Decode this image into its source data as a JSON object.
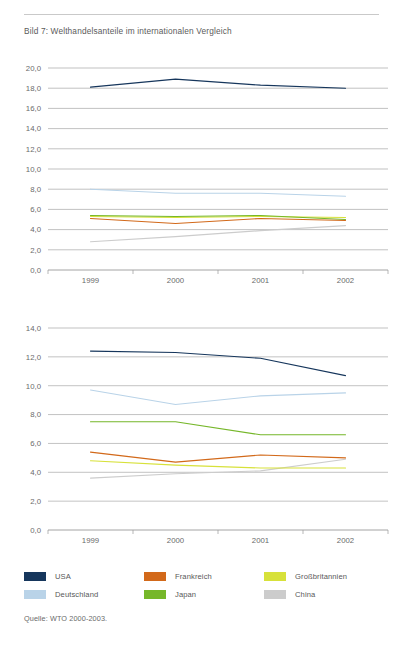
{
  "figure": {
    "title": "Bild 7: Welthandelsanteile im internationalen Vergleich",
    "source": "Quelle: WTO 2000-2003."
  },
  "legend": {
    "position": "bottom",
    "items": [
      {
        "label": "USA",
        "color": "#16365c",
        "key": "usa"
      },
      {
        "label": "Frankreich",
        "color": "#d2691a",
        "key": "frankreich"
      },
      {
        "label": "Großbritannien",
        "color": "#d7e13a",
        "key": "grossbritannien"
      },
      {
        "label": "Deutschland",
        "color": "#b9d3e8",
        "key": "deutschland"
      },
      {
        "label": "Japan",
        "color": "#76b72a",
        "key": "japan"
      },
      {
        "label": "China",
        "color": "#cccccc",
        "key": "china"
      }
    ]
  },
  "chart_data": [
    {
      "id": "exports",
      "type": "line",
      "title": "",
      "xlabel": "",
      "ylabel": "",
      "x": [
        "1999",
        "2000",
        "2001",
        "2002"
      ],
      "categories": [
        "1999",
        "2000",
        "2001",
        "2002"
      ],
      "ylim": [
        0.0,
        20.0
      ],
      "yticks": [
        0.0,
        2.0,
        4.0,
        6.0,
        8.0,
        10.0,
        12.0,
        14.0,
        16.0,
        18.0,
        20.0
      ],
      "ytick_labels": [
        "0,0",
        "2,0",
        "4,0",
        "6,0",
        "8,0",
        "10,0",
        "12,0",
        "14,0",
        "16,0",
        "18,0",
        "20,0"
      ],
      "grid": true,
      "series": [
        {
          "name": "USA",
          "color": "#16365c",
          "values": [
            18.1,
            18.9,
            18.3,
            18.0
          ]
        },
        {
          "name": "Deutschland",
          "color": "#b9d3e8",
          "values": [
            8.0,
            7.6,
            7.6,
            7.3
          ]
        },
        {
          "name": "Japan",
          "color": "#76b72a",
          "values": [
            5.4,
            5.3,
            5.4,
            5.0
          ]
        },
        {
          "name": "Großbritannien",
          "color": "#d7e13a",
          "values": [
            5.3,
            5.2,
            5.3,
            5.2
          ]
        },
        {
          "name": "Frankreich",
          "color": "#d2691a",
          "values": [
            5.1,
            4.6,
            5.1,
            4.9
          ]
        },
        {
          "name": "China",
          "color": "#cccccc",
          "values": [
            2.8,
            3.3,
            3.9,
            4.4
          ]
        }
      ]
    },
    {
      "id": "imports",
      "type": "line",
      "title": "",
      "xlabel": "",
      "ylabel": "",
      "x": [
        "1999",
        "2000",
        "2001",
        "2002"
      ],
      "categories": [
        "1999",
        "2000",
        "2001",
        "2002"
      ],
      "ylim": [
        0.0,
        14.0
      ],
      "yticks": [
        0.0,
        2.0,
        4.0,
        6.0,
        8.0,
        10.0,
        12.0,
        14.0
      ],
      "ytick_labels": [
        "0,0",
        "2,0",
        "4,0",
        "6,0",
        "8,0",
        "10,0",
        "12,0",
        "14,0"
      ],
      "grid": true,
      "series": [
        {
          "name": "USA",
          "color": "#16365c",
          "values": [
            12.4,
            12.3,
            11.9,
            10.7
          ]
        },
        {
          "name": "Deutschland",
          "color": "#b9d3e8",
          "values": [
            9.7,
            8.7,
            9.3,
            9.5
          ]
        },
        {
          "name": "Japan",
          "color": "#76b72a",
          "values": [
            7.5,
            7.5,
            6.6,
            6.6
          ]
        },
        {
          "name": "Frankreich",
          "color": "#d2691a",
          "values": [
            5.4,
            4.7,
            5.2,
            5.0
          ]
        },
        {
          "name": "Großbritannien",
          "color": "#d7e13a",
          "values": [
            4.8,
            4.5,
            4.3,
            4.3
          ]
        },
        {
          "name": "China",
          "color": "#cccccc",
          "values": [
            3.6,
            3.9,
            4.1,
            4.9
          ]
        }
      ]
    }
  ]
}
